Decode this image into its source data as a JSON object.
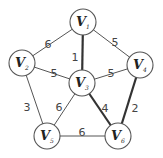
{
  "graph": {
    "nodes": [
      {
        "id": "V1",
        "letter": "V",
        "sub": "1"
      },
      {
        "id": "V2",
        "letter": "V",
        "sub": "2"
      },
      {
        "id": "V3",
        "letter": "V",
        "sub": "3"
      },
      {
        "id": "V4",
        "letter": "V",
        "sub": "4"
      },
      {
        "id": "V5",
        "letter": "V",
        "sub": "5"
      },
      {
        "id": "V6",
        "letter": "V",
        "sub": "6"
      }
    ],
    "edges": [
      {
        "from": "V1",
        "to": "V2",
        "weight": "6",
        "highlighted": false
      },
      {
        "from": "V1",
        "to": "V3",
        "weight": "1",
        "highlighted": true
      },
      {
        "from": "V1",
        "to": "V4",
        "weight": "5",
        "highlighted": false
      },
      {
        "from": "V2",
        "to": "V3",
        "weight": "5",
        "highlighted": false
      },
      {
        "from": "V3",
        "to": "V4",
        "weight": "5",
        "highlighted": false
      },
      {
        "from": "V2",
        "to": "V5",
        "weight": "3",
        "highlighted": false
      },
      {
        "from": "V3",
        "to": "V5",
        "weight": "6",
        "highlighted": false
      },
      {
        "from": "V3",
        "to": "V6",
        "weight": "4",
        "highlighted": true
      },
      {
        "from": "V4",
        "to": "V6",
        "weight": "2",
        "highlighted": true
      },
      {
        "from": "V5",
        "to": "V6",
        "weight": "6",
        "highlighted": false
      }
    ]
  }
}
